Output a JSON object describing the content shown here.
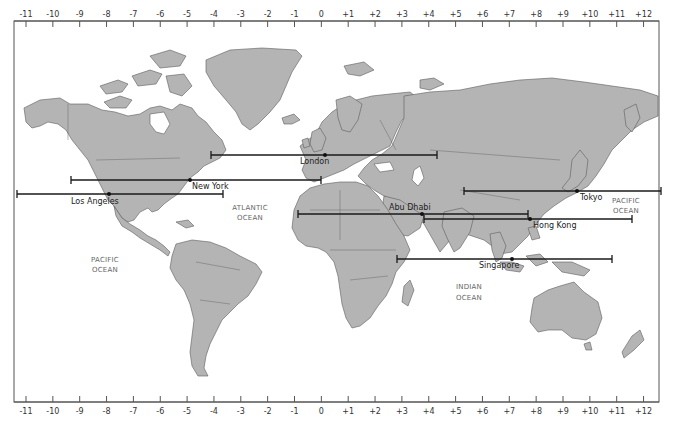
{
  "map": {
    "type": "world-time-zone-map",
    "projection": "mercator",
    "colors": {
      "land": "#b4b4b4",
      "land_border": "#5c5c5c",
      "water": "#ffffff",
      "span_line": "#1a1a1a",
      "ocean_text": "#666666",
      "city_text": "#222222"
    },
    "time_zone_axis": {
      "top_labels": [
        "-11",
        "-10",
        "-9",
        "-8",
        "-7",
        "-6",
        "-5",
        "-4",
        "-3",
        "-2",
        "-1",
        "0",
        "+1",
        "+2",
        "+3",
        "+4",
        "+5",
        "+6",
        "+7",
        "+8",
        "+9",
        "+10",
        "+11",
        "+12"
      ],
      "bottom_labels": [
        "-11",
        "-10",
        "-9",
        "-8",
        "-7",
        "-6",
        "-5",
        "-4",
        "-3",
        "-2",
        "-1",
        "0",
        "+1",
        "+2",
        "+3",
        "+4",
        "+5",
        "+6",
        "+7",
        "+8",
        "+9",
        "+10",
        "+11",
        "+12"
      ]
    },
    "oceans": [
      {
        "line1": "ATLANTIC",
        "line2": "OCEAN"
      },
      {
        "line1": "PACIFIC",
        "line2": "OCEAN"
      },
      {
        "line1": "PACIFIC",
        "line2": "OCEAN"
      },
      {
        "line1": "INDIAN",
        "line2": "OCEAN"
      }
    ],
    "cities": [
      {
        "name": "London",
        "utc_offset": 0,
        "span_from": -4,
        "span_to": 4
      },
      {
        "name": "New York",
        "utc_offset": -5,
        "span_from": -9,
        "span_to": 0
      },
      {
        "name": "Los Angeles",
        "utc_offset": -8,
        "span_from": -11,
        "span_to": -4
      },
      {
        "name": "Tokyo",
        "utc_offset": 9,
        "span_from": 5,
        "span_to": 12
      },
      {
        "name": "Abu Dhabi",
        "utc_offset": 4,
        "span_from": -1,
        "span_to": 8
      },
      {
        "name": "Hong Kong",
        "utc_offset": 8,
        "span_from": 4,
        "span_to": 11
      },
      {
        "name": "Singapore",
        "utc_offset": 8,
        "span_from": 3,
        "span_to": 11
      }
    ]
  }
}
